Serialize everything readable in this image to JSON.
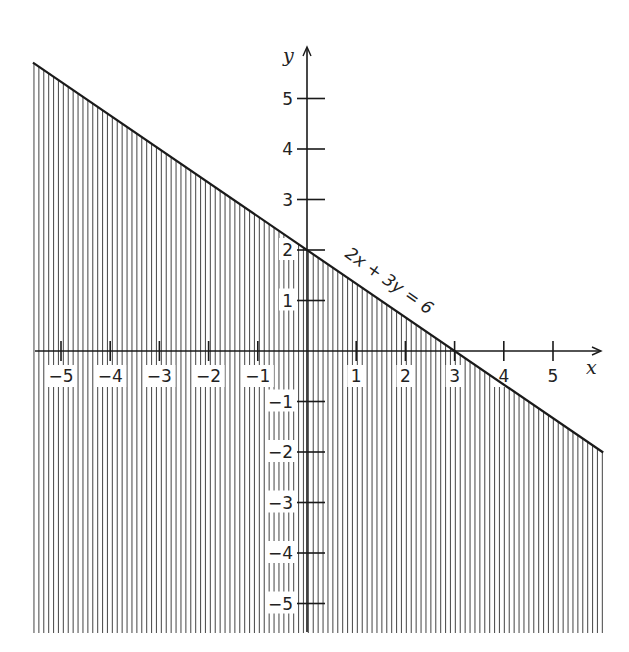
{
  "chart_data": {
    "type": "line",
    "title": "",
    "xlabel": "x",
    "ylabel": "y",
    "xlim": [
      -5.6,
      6.0
    ],
    "ylim": [
      -5.6,
      5.9
    ],
    "grid": false,
    "x_ticks": [
      -5,
      -4,
      -3,
      -2,
      -1,
      1,
      2,
      3,
      4,
      5
    ],
    "x_tick_labels": [
      "−5",
      "−4",
      "−3",
      "−2",
      "−1",
      "1",
      "2",
      "3",
      "4",
      "5"
    ],
    "y_ticks": [
      5,
      4,
      3,
      2,
      1,
      -1,
      -2,
      -3,
      -4,
      -5
    ],
    "y_tick_labels": [
      "5",
      "4",
      "3",
      "2",
      "1",
      "−1",
      "−2",
      "−3",
      "−4",
      "−5"
    ],
    "series": [
      {
        "name": "2x + 3y = 6",
        "equation": "2x + 3y = 6",
        "x": [
          -5.57,
          6.02
        ],
        "y": [
          5.71,
          -2.01
        ]
      }
    ],
    "shaded_region": {
      "inequality": "2x + 3y ≤ 6",
      "description": "Region below the line shaded with vertical hatching",
      "hatch": "vertical"
    },
    "annotations": [
      {
        "text": "2x + 3y = 6",
        "x": 1.5,
        "y": 1.0,
        "rotation_deg": 34
      }
    ]
  },
  "labels": {
    "x_axis": "x",
    "y_axis": "y",
    "equation": "2x + 3y = 6"
  },
  "colors": {
    "ink": "#1a1a1a",
    "hatch": "#555555",
    "background": "#ffffff"
  }
}
